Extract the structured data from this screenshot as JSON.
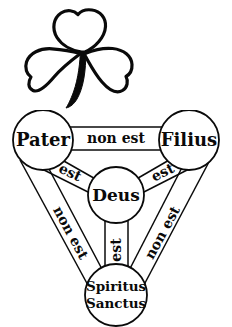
{
  "figure": {
    "background_color": "#ffffff",
    "ink_color": "#0a0a0a"
  },
  "shamrock": {
    "icon_name": "shamrock-icon",
    "description": "three-leaf clover outline with thick curved stem",
    "outline_color": "#0a0a0a",
    "fill_color": "#ffffff"
  },
  "diagram": {
    "name": "scutum-fidei",
    "nodes": [
      {
        "id": "pater",
        "label": "Pater",
        "lines": [
          "Pater"
        ]
      },
      {
        "id": "filius",
        "label": "Filius",
        "lines": [
          "Filius"
        ]
      },
      {
        "id": "deus",
        "label": "Deus",
        "lines": [
          "Deus"
        ]
      },
      {
        "id": "spiritus-sanctus",
        "label": "Spiritus Sanctus",
        "lines": [
          "Spiritus",
          "Sanctus"
        ]
      }
    ],
    "edges": [
      {
        "id": "pater-filius",
        "from": "Pater",
        "to": "Filius",
        "label": "non est"
      },
      {
        "id": "pater-spiritus",
        "from": "Pater",
        "to": "Spiritus Sanctus",
        "label": "non est"
      },
      {
        "id": "filius-spiritus",
        "from": "Filius",
        "to": "Spiritus Sanctus",
        "label": "non est"
      },
      {
        "id": "pater-deus",
        "from": "Pater",
        "to": "Deus",
        "label": "est"
      },
      {
        "id": "filius-deus",
        "from": "Filius",
        "to": "Deus",
        "label": "est"
      },
      {
        "id": "spiritus-deus",
        "from": "Spiritus Sanctus",
        "to": "Deus",
        "label": "est"
      }
    ]
  }
}
